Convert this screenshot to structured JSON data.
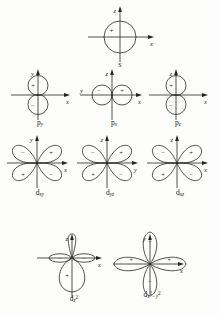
{
  "figure": {
    "background_color": "#fdfdfb",
    "line_color": "#242424",
    "rows": [
      {
        "row_name": "s-orbital-row",
        "orbitals": [
          {
            "id": "s",
            "label_main": "s",
            "label_sub": "",
            "label_sup": "",
            "shape": "sphere",
            "axes": [
              {
                "name": "z",
                "direction": "up"
              },
              {
                "name": "x",
                "direction": "right"
              }
            ],
            "lobes": [
              {
                "position": "center",
                "sign": "+"
              }
            ]
          }
        ]
      },
      {
        "row_name": "p-orbital-row",
        "orbitals": [
          {
            "id": "p_y",
            "label_main": "p",
            "label_sub": "y",
            "label_sup": "",
            "shape": "dumbbell-vertical",
            "axes": [
              {
                "name": "y",
                "direction": "up"
              },
              {
                "name": "x",
                "direction": "right"
              }
            ],
            "lobes": [
              {
                "position": "up",
                "sign": "+"
              },
              {
                "position": "down",
                "sign": "−"
              }
            ]
          },
          {
            "id": "p_x",
            "label_main": "p",
            "label_sub": "x",
            "label_sup": "",
            "shape": "dumbbell-horizontal",
            "axes": [
              {
                "name": "z",
                "direction": "up"
              },
              {
                "name": "x",
                "direction": "right"
              },
              {
                "name": "y",
                "direction": "left"
              }
            ],
            "lobes": [
              {
                "position": "left",
                "sign": "−"
              },
              {
                "position": "right",
                "sign": "+"
              }
            ]
          },
          {
            "id": "p_z",
            "label_main": "p",
            "label_sub": "z",
            "label_sup": "",
            "shape": "dumbbell-vertical",
            "axes": [
              {
                "name": "z",
                "direction": "up"
              },
              {
                "name": "x",
                "direction": "right"
              }
            ],
            "lobes": [
              {
                "position": "up",
                "sign": "+"
              },
              {
                "position": "down",
                "sign": "−"
              }
            ]
          }
        ]
      },
      {
        "row_name": "d-orbital-row-1",
        "orbitals": [
          {
            "id": "d_xy",
            "label_main": "d",
            "label_sub": "xy",
            "label_sup": "",
            "shape": "cloverleaf-diagonal",
            "axes": [
              {
                "name": "y",
                "direction": "up"
              },
              {
                "name": "x",
                "direction": "right"
              }
            ],
            "lobes": [
              {
                "position": "upper-left",
                "sign": "−"
              },
              {
                "position": "upper-right",
                "sign": "+"
              },
              {
                "position": "lower-left",
                "sign": "+"
              },
              {
                "position": "lower-right",
                "sign": "−"
              }
            ]
          },
          {
            "id": "d_yz",
            "label_main": "d",
            "label_sub": "yz",
            "label_sup": "",
            "shape": "cloverleaf-diagonal",
            "axes": [
              {
                "name": "z",
                "direction": "up"
              },
              {
                "name": "y",
                "direction": "right"
              }
            ],
            "lobes": [
              {
                "position": "upper-left",
                "sign": "−"
              },
              {
                "position": "upper-right",
                "sign": "+"
              },
              {
                "position": "lower-left",
                "sign": "+"
              },
              {
                "position": "lower-right",
                "sign": "−"
              }
            ]
          },
          {
            "id": "d_xz",
            "label_main": "d",
            "label_sub": "xz",
            "label_sup": "",
            "shape": "cloverleaf-diagonal",
            "axes": [
              {
                "name": "z",
                "direction": "up"
              },
              {
                "name": "x",
                "direction": "right"
              }
            ],
            "lobes": [
              {
                "position": "upper-left",
                "sign": "−"
              },
              {
                "position": "upper-right",
                "sign": "+"
              },
              {
                "position": "lower-left",
                "sign": "+"
              },
              {
                "position": "lower-right",
                "sign": "−"
              }
            ]
          }
        ]
      },
      {
        "row_name": "d-orbital-row-2",
        "orbitals": [
          {
            "id": "d_z2",
            "label_main": "d",
            "label_sub": "z",
            "label_sup": "2",
            "shape": "dz2-with-torus",
            "axes": [
              {
                "name": "z",
                "direction": "up"
              },
              {
                "name": "x",
                "direction": "right"
              }
            ],
            "lobes": [
              {
                "position": "up",
                "sign": "+"
              },
              {
                "position": "down",
                "sign": "+"
              },
              {
                "position": "torus-left",
                "sign": "−"
              },
              {
                "position": "torus-right",
                "sign": "−"
              }
            ]
          },
          {
            "id": "d_x2y2",
            "label_main": "d",
            "label_sub": "x",
            "label_sup": "2",
            "label_sub2": "y",
            "label_sup2": "2",
            "label_minus": "−",
            "shape": "cloverleaf-axial",
            "axes": [
              {
                "name": "y",
                "direction": "up"
              },
              {
                "name": "x",
                "direction": "right"
              }
            ],
            "lobes": [
              {
                "position": "left",
                "sign": "+"
              },
              {
                "position": "right",
                "sign": "+"
              },
              {
                "position": "up",
                "sign": "−"
              },
              {
                "position": "down",
                "sign": "−"
              }
            ]
          }
        ]
      }
    ]
  }
}
